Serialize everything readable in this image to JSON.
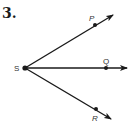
{
  "problem": {
    "number": "3."
  },
  "diagram": {
    "vertex": {
      "label": "S"
    },
    "rays": [
      {
        "label": "P",
        "point_label": "P"
      },
      {
        "label": "Q",
        "point_label": "Q"
      },
      {
        "label": "R",
        "point_label": "R"
      }
    ],
    "colors": {
      "stroke": "#1a1a1a",
      "background": "#ffffff"
    }
  }
}
